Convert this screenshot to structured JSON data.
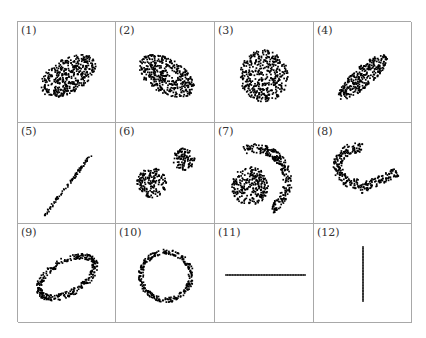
{
  "chart_data": {
    "type": "scatter",
    "title": "",
    "layout": {
      "rows": 3,
      "cols": 4,
      "grid": true,
      "axes": false
    },
    "point_color": "#000000",
    "border_color": "#a8a8a8",
    "panels": [
      {
        "label": "(1)",
        "shape": "filled-ellipse",
        "cx": 50,
        "cy": 54,
        "rx": 31,
        "ry": 17,
        "angle": -30,
        "n": 420
      },
      {
        "label": "(2)",
        "shape": "filled-ellipse",
        "cx": 50,
        "cy": 54,
        "rx": 31,
        "ry": 17,
        "angle": 30,
        "n": 420
      },
      {
        "label": "(3)",
        "shape": "filled-ellipse",
        "cx": 49,
        "cy": 54,
        "rx": 24,
        "ry": 26,
        "angle": 0,
        "n": 420
      },
      {
        "label": "(4)",
        "shape": "filled-ellipse",
        "cx": 49,
        "cy": 55,
        "rx": 32,
        "ry": 10,
        "angle": -42,
        "n": 300
      },
      {
        "label": "(5)",
        "shape": "line",
        "x1": 26,
        "y1": 93,
        "x2": 73,
        "y2": 32,
        "jitter": 1.2,
        "n": 90
      },
      {
        "label": "(6)",
        "shape": "two-blobs",
        "blobs": [
          {
            "cx": 36,
            "cy": 60,
            "r": 15,
            "n": 170
          },
          {
            "cx": 68,
            "cy": 36,
            "r": 11,
            "n": 110
          }
        ]
      },
      {
        "label": "(7)",
        "shape": "circle-and-arc",
        "circle": {
          "cx": 35,
          "cy": 63,
          "r": 19,
          "n": 260
        },
        "arc": {
          "cx": 40,
          "cy": 58,
          "r_in": 28,
          "r_out": 37,
          "start": -110,
          "end": 60,
          "n": 260
        }
      },
      {
        "label": "(8)",
        "shape": "u-arc",
        "cx": 42,
        "cy": 43,
        "r_in": 13,
        "r_out": 23,
        "start": 80,
        "end": 290,
        "tail": {
          "x1": 46,
          "y1": 66,
          "x2": 83,
          "y2": 49,
          "w": 9,
          "n": 110
        },
        "n": 180
      },
      {
        "label": "(9)",
        "shape": "ring-ellipse",
        "cx": 49,
        "cy": 53,
        "rx": 31,
        "ry": 16,
        "thickness": 6,
        "angle": -30,
        "n": 320
      },
      {
        "label": "(10)",
        "shape": "ring-ellipse",
        "cx": 50,
        "cy": 52,
        "rx": 25,
        "ry": 24,
        "thickness": 5,
        "angle": 0,
        "n": 280
      },
      {
        "label": "(11)",
        "shape": "line",
        "x1": 11,
        "y1": 51,
        "x2": 90,
        "y2": 51,
        "jitter": 0.0,
        "n": 50,
        "regular": true
      },
      {
        "label": "(12)",
        "shape": "line",
        "x1": 49,
        "y1": 23,
        "x2": 49,
        "y2": 77,
        "jitter": 0.0,
        "n": 36,
        "regular": true
      }
    ]
  }
}
